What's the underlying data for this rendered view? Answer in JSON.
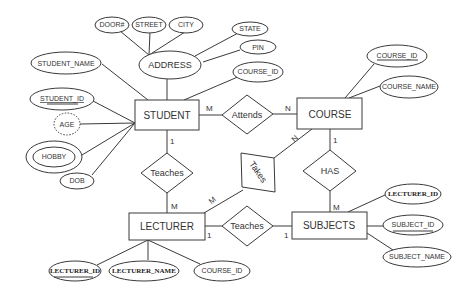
{
  "diagram": {
    "type": "ER diagram",
    "entities": {
      "student": "STUDENT",
      "course": "COURSE",
      "lecturer": "LECTURER",
      "subjects": "SUBJECTS"
    },
    "relationships": {
      "attends": "Attends",
      "teaches_student": "Teaches",
      "takes": "Takes",
      "has": "HAS",
      "teaches_subjects": "Teaches"
    },
    "attributes": {
      "address": "ADDRESS",
      "door": "DOOR#",
      "street": "STREET",
      "city": "CITY",
      "state": "STATE",
      "pin": "PIN",
      "student_name": "STUDENT_NAME",
      "student_course_id": "COURSE_ID",
      "student_id": "STUDENT_ID",
      "age": "AGE",
      "hobby": "HOBBY",
      "dob": "DOB",
      "course_id": "COURSE_ID",
      "course_name": "COURSE_NAME",
      "lecturer_id": "LECTURER_ID",
      "lecturer_name": "LECTURER_NAME",
      "lecturer_course_id": "COURSE_ID",
      "subj_lecturer_id": "LECTURER_ID",
      "subject_id": "SUBJECT_ID",
      "subject_name": "SUBJECT_NAME"
    },
    "cardinalities": {
      "student_attends": "M",
      "attends_course": "N",
      "student_teaches": "1",
      "teaches_lecturer": "M",
      "course_takes": "N",
      "takes_lecturer": "M",
      "course_has": "1",
      "has_subjects": "M",
      "lecturer_teaches": "1",
      "teaches_subjects": "1"
    }
  }
}
